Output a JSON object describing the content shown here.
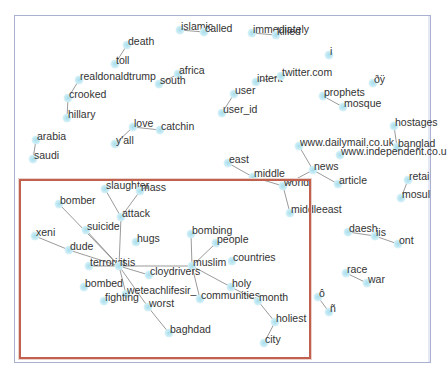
{
  "graph": {
    "type": "word co-occurrence network",
    "frame": {
      "x": 14,
      "y": 15,
      "w": 415,
      "h": 346,
      "color": "#a9b0d0"
    },
    "highlight_box": {
      "x": 19,
      "y": 179,
      "w": 288,
      "h": 176,
      "color": "#c0604e"
    },
    "node_color": "#a6dcec",
    "edge_color": "#555555",
    "nodes": [
      {
        "id": "islamic",
        "label": "islamic",
        "x": 180,
        "y": 30
      },
      {
        "id": "called",
        "label": "called",
        "x": 204,
        "y": 32
      },
      {
        "id": "immediately",
        "label": "immediately",
        "x": 252,
        "y": 33
      },
      {
        "id": "killed",
        "label": "killed",
        "x": 276,
        "y": 35
      },
      {
        "id": "death",
        "label": "death",
        "x": 127,
        "y": 45
      },
      {
        "id": "i",
        "label": "i",
        "x": 329,
        "y": 55
      },
      {
        "id": "toll",
        "label": "toll",
        "x": 115,
        "y": 64
      },
      {
        "id": "africa",
        "label": "africa",
        "x": 178,
        "y": 74
      },
      {
        "id": "realdonaldtrump",
        "label": "realdonaldtrump",
        "x": 79,
        "y": 80
      },
      {
        "id": "south",
        "label": "south",
        "x": 159,
        "y": 84
      },
      {
        "id": "intent",
        "label": "intent",
        "x": 256,
        "y": 82
      },
      {
        "id": "twitter.com",
        "label": "twitter.com",
        "x": 281,
        "y": 76
      },
      {
        "id": "oy",
        "label": "ðÿ",
        "x": 373,
        "y": 83
      },
      {
        "id": "user",
        "label": "user",
        "x": 234,
        "y": 94
      },
      {
        "id": "prophets",
        "label": "prophets",
        "x": 323,
        "y": 96
      },
      {
        "id": "crooked",
        "label": "crooked",
        "x": 68,
        "y": 98
      },
      {
        "id": "mosque",
        "label": "mosque",
        "x": 343,
        "y": 107
      },
      {
        "id": "user_id",
        "label": "user_id",
        "x": 222,
        "y": 113
      },
      {
        "id": "hillary",
        "label": "hillary",
        "x": 67,
        "y": 118
      },
      {
        "id": "hostages",
        "label": "hostages",
        "x": 394,
        "y": 126
      },
      {
        "id": "love",
        "label": "love",
        "x": 133,
        "y": 127
      },
      {
        "id": "catchin",
        "label": "catchin",
        "x": 160,
        "y": 130
      },
      {
        "id": "arabia",
        "label": "arabia",
        "x": 36,
        "y": 140
      },
      {
        "id": "yall",
        "label": "y'all",
        "x": 115,
        "y": 144
      },
      {
        "id": "dailymail",
        "label": "www.dailymail.co.uk",
        "x": 299,
        "y": 146
      },
      {
        "id": "banglad",
        "label": "banglad",
        "x": 397,
        "y": 147
      },
      {
        "id": "independent",
        "label": "www.independent.co.u",
        "x": 340,
        "y": 155
      },
      {
        "id": "saudi",
        "label": "saudi",
        "x": 33,
        "y": 159
      },
      {
        "id": "east",
        "label": "east",
        "x": 228,
        "y": 163
      },
      {
        "id": "news",
        "label": "news",
        "x": 313,
        "y": 170
      },
      {
        "id": "middle",
        "label": "middle",
        "x": 253,
        "y": 177
      },
      {
        "id": "retail",
        "label": "retai",
        "x": 408,
        "y": 180
      },
      {
        "id": "world",
        "label": "world",
        "x": 283,
        "y": 186
      },
      {
        "id": "article",
        "label": "article",
        "x": 338,
        "y": 184
      },
      {
        "id": "mosul",
        "label": "mosul",
        "x": 401,
        "y": 198
      },
      {
        "id": "middleeast",
        "label": "middleeast",
        "x": 290,
        "y": 213
      },
      {
        "id": "slaughter",
        "label": "slaughter",
        "x": 105,
        "y": 189
      },
      {
        "id": "mass",
        "label": "mass",
        "x": 140,
        "y": 191
      },
      {
        "id": "bomber",
        "label": "bomber",
        "x": 59,
        "y": 204
      },
      {
        "id": "attack",
        "label": "attack",
        "x": 121,
        "y": 217
      },
      {
        "id": "suicide",
        "label": "suicide",
        "x": 86,
        "y": 230
      },
      {
        "id": "xeni",
        "label": "xeni",
        "x": 35,
        "y": 236
      },
      {
        "id": "hugs",
        "label": "hugs",
        "x": 136,
        "y": 242
      },
      {
        "id": "bombing",
        "label": "bombing",
        "x": 191,
        "y": 234
      },
      {
        "id": "daesh",
        "label": "daesh",
        "x": 348,
        "y": 232
      },
      {
        "id": "iis",
        "label": "iis",
        "x": 375,
        "y": 236
      },
      {
        "id": "people",
        "label": "people",
        "x": 216,
        "y": 243
      },
      {
        "id": "dude",
        "label": "dude",
        "x": 69,
        "y": 250
      },
      {
        "id": "ont",
        "label": "ont",
        "x": 398,
        "y": 244
      },
      {
        "id": "countries",
        "label": "countries",
        "x": 232,
        "y": 261
      },
      {
        "id": "terrorist",
        "label": "terrorist",
        "x": 89,
        "y": 266
      },
      {
        "id": "isis",
        "label": "isis",
        "x": 119,
        "y": 266
      },
      {
        "id": "muslim",
        "label": "muslim",
        "x": 192,
        "y": 266
      },
      {
        "id": "cloydrivers",
        "label": "cloydrivers",
        "x": 149,
        "y": 275
      },
      {
        "id": "race",
        "label": "race",
        "x": 346,
        "y": 273
      },
      {
        "id": "holy",
        "label": "holy",
        "x": 231,
        "y": 287
      },
      {
        "id": "bombed",
        "label": "bombed",
        "x": 84,
        "y": 287
      },
      {
        "id": "war",
        "label": "war",
        "x": 367,
        "y": 283
      },
      {
        "id": "weteachlifesir_",
        "label": "weteachlifesir_",
        "x": 126,
        "y": 294
      },
      {
        "id": "communities",
        "label": "communities",
        "x": 200,
        "y": 299
      },
      {
        "id": "month",
        "label": "month",
        "x": 258,
        "y": 301
      },
      {
        "id": "fighting",
        "label": "fighting",
        "x": 104,
        "y": 301
      },
      {
        "id": "o_small",
        "label": "ô",
        "x": 318,
        "y": 297
      },
      {
        "id": "worst",
        "label": "worst",
        "x": 148,
        "y": 307
      },
      {
        "id": "n_tilde",
        "label": "ñ",
        "x": 329,
        "y": 312
      },
      {
        "id": "holiest",
        "label": "holiest",
        "x": 275,
        "y": 322
      },
      {
        "id": "baghdad",
        "label": "baghdad",
        "x": 169,
        "y": 333
      },
      {
        "id": "city",
        "label": "city",
        "x": 264,
        "y": 343
      }
    ],
    "edges": [
      [
        "death",
        "toll"
      ],
      [
        "realdonaldtrump",
        "crooked"
      ],
      [
        "crooked",
        "hillary"
      ],
      [
        "love",
        "yall"
      ],
      [
        "love",
        "catchin"
      ],
      [
        "africa",
        "south"
      ],
      [
        "intent",
        "twitter.com"
      ],
      [
        "islamic",
        "called"
      ],
      [
        "immediately",
        "killed"
      ],
      [
        "prophets",
        "mosque"
      ],
      [
        "user",
        "user_id"
      ],
      [
        "arabia",
        "saudi"
      ],
      [
        "hostages",
        "banglad"
      ],
      [
        "dailymail",
        "news"
      ],
      [
        "news",
        "article"
      ],
      [
        "news",
        "world"
      ],
      [
        "east",
        "middle"
      ],
      [
        "middle",
        "world"
      ],
      [
        "world",
        "middleeast"
      ],
      [
        "retail",
        "mosul"
      ],
      [
        "slaughter",
        "attack"
      ],
      [
        "mass",
        "attack"
      ],
      [
        "bomber",
        "isis"
      ],
      [
        "suicide",
        "isis"
      ],
      [
        "attack",
        "isis"
      ],
      [
        "xeni",
        "dude"
      ],
      [
        "dude",
        "isis"
      ],
      [
        "terrorist",
        "isis"
      ],
      [
        "isis",
        "cloydrivers"
      ],
      [
        "isis",
        "muslim"
      ],
      [
        "isis",
        "weteachlifesir_"
      ],
      [
        "isis",
        "worst"
      ],
      [
        "worst",
        "baghdad"
      ],
      [
        "bombing",
        "muslim"
      ],
      [
        "muslim",
        "people"
      ],
      [
        "muslim",
        "communities"
      ],
      [
        "muslim",
        "holy"
      ],
      [
        "holy",
        "month"
      ],
      [
        "month",
        "holiest"
      ],
      [
        "holiest",
        "city"
      ],
      [
        "daesh",
        "iis"
      ],
      [
        "iis",
        "ont"
      ],
      [
        "race",
        "war"
      ],
      [
        "o_small",
        "n_tilde"
      ]
    ]
  }
}
